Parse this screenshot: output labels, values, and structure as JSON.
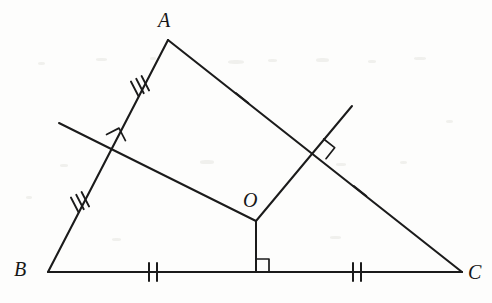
{
  "figure": {
    "type": "geometry-diagram",
    "canvas": {
      "width": 492,
      "height": 303,
      "background": "#fdfdfc"
    },
    "stroke_color": "#1b1b1b"
  },
  "labels": {
    "vertex_a": "A",
    "vertex_b": "B",
    "vertex_c": "C",
    "point_o": "O"
  },
  "label_positions": {
    "vertex_a": {
      "x": 158,
      "y": 10
    },
    "vertex_b": {
      "x": 14,
      "y": 259
    },
    "vertex_c": {
      "x": 468,
      "y": 262
    },
    "point_o": {
      "x": 243,
      "y": 190
    }
  },
  "points": {
    "A": {
      "x": 168,
      "y": 40
    },
    "B": {
      "x": 48,
      "y": 272
    },
    "C": {
      "x": 462,
      "y": 272
    },
    "O": {
      "x": 256,
      "y": 221
    },
    "midpoint_AB": {
      "x": 113,
      "y": 147
    },
    "midpoint_AC": {
      "x": 315,
      "y": 150
    },
    "midpoint_BC": {
      "x": 256,
      "y": 272
    }
  },
  "sides": [
    {
      "name": "AB",
      "from": "A",
      "to": "B",
      "tick_count": 3
    },
    {
      "name": "AC",
      "from": "A",
      "to": "C",
      "tick_count": 1
    },
    {
      "name": "BC",
      "from": "B",
      "to": "C",
      "tick_count": 2
    }
  ],
  "segments": [
    {
      "name": "side-ab",
      "x1": 168,
      "y1": 40,
      "x2": 48,
      "y2": 272
    },
    {
      "name": "side-ac",
      "x1": 168,
      "y1": 40,
      "x2": 462,
      "y2": 272
    },
    {
      "name": "side-bc",
      "x1": 48,
      "y1": 272,
      "x2": 462,
      "y2": 272
    },
    {
      "name": "bisector-ab-ray",
      "x1": 59,
      "y1": 123,
      "x2": 256,
      "y2": 221
    },
    {
      "name": "bisector-ac-ray",
      "x1": 352,
      "y1": 106,
      "x2": 256,
      "y2": 221
    },
    {
      "name": "bisector-bc-ray",
      "x1": 256,
      "y1": 221,
      "x2": 256,
      "y2": 272
    }
  ],
  "tick_marks": [
    {
      "name": "tick-ab-upper",
      "count": 3,
      "x": 140,
      "y": 86,
      "angle": 62.6
    },
    {
      "name": "tick-ab-lower",
      "count": 3,
      "x": 80,
      "y": 202,
      "angle": 62.6
    },
    {
      "name": "tick-ac-upper",
      "count": 1,
      "x": 242,
      "y": 98,
      "angle": 38.3
    },
    {
      "name": "tick-ac-lower",
      "count": 1,
      "x": 360,
      "y": 191,
      "angle": 38.3
    },
    {
      "name": "tick-bc-left",
      "count": 2,
      "x": 153,
      "y": 272,
      "angle": 0
    },
    {
      "name": "tick-bc-right",
      "count": 2,
      "x": 357,
      "y": 272,
      "angle": 0
    }
  ],
  "right_angles": [
    {
      "name": "right-angle-ab",
      "x": 113,
      "y": 147,
      "size": 13,
      "rotation": -27.4
    },
    {
      "name": "right-angle-ac",
      "x": 315,
      "y": 150,
      "size": 13,
      "rotation": 38.3
    },
    {
      "name": "right-angle-bc",
      "x": 256,
      "y": 272,
      "size": 13,
      "rotation": 0
    }
  ],
  "scan_specks": [
    {
      "x": 38,
      "y": 62,
      "w": 7,
      "h": 3
    },
    {
      "x": 96,
      "y": 58,
      "w": 11,
      "h": 3
    },
    {
      "x": 150,
      "y": 57,
      "w": 6,
      "h": 3
    },
    {
      "x": 228,
      "y": 60,
      "w": 16,
      "h": 4
    },
    {
      "x": 268,
      "y": 59,
      "w": 9,
      "h": 3
    },
    {
      "x": 316,
      "y": 58,
      "w": 13,
      "h": 4
    },
    {
      "x": 368,
      "y": 60,
      "w": 8,
      "h": 3
    },
    {
      "x": 414,
      "y": 57,
      "w": 12,
      "h": 3
    },
    {
      "x": 60,
      "y": 164,
      "w": 8,
      "h": 3
    },
    {
      "x": 200,
      "y": 160,
      "w": 14,
      "h": 4
    },
    {
      "x": 336,
      "y": 163,
      "w": 10,
      "h": 3
    },
    {
      "x": 400,
      "y": 161,
      "w": 7,
      "h": 3
    },
    {
      "x": 112,
      "y": 238,
      "w": 9,
      "h": 3
    },
    {
      "x": 330,
      "y": 236,
      "w": 11,
      "h": 3
    },
    {
      "x": 26,
      "y": 196,
      "w": 6,
      "h": 3
    },
    {
      "x": 446,
      "y": 120,
      "w": 7,
      "h": 3
    }
  ]
}
